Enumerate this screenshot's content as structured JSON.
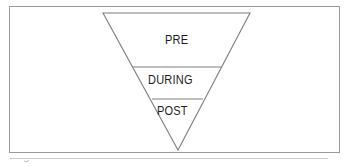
{
  "canvas": {
    "width": 358,
    "height": 167,
    "background": "#ffffff"
  },
  "frame": {
    "border_color": "#9b9b9b",
    "fill": "#ffffff"
  },
  "diagram": {
    "type": "inverted-triangle",
    "shape_name": "inverted triangle funnel",
    "stroke_color": "#7f7f7f",
    "fill": "none",
    "orientation": "apex-down",
    "tiers": [
      {
        "label": "PRE"
      },
      {
        "label": "DURING"
      },
      {
        "label": "POST"
      }
    ]
  },
  "caption": {
    "clipped_text": "Figure 1"
  },
  "geometry": {
    "triangle": {
      "top_left_x": 103,
      "top_right_x": 250,
      "top_y": 13,
      "apex_x": 178,
      "apex_y": 150
    },
    "dividers": [
      {
        "y": 67,
        "x1": 133,
        "x2": 221
      },
      {
        "y": 99,
        "x1": 152,
        "x2": 203
      }
    ]
  }
}
